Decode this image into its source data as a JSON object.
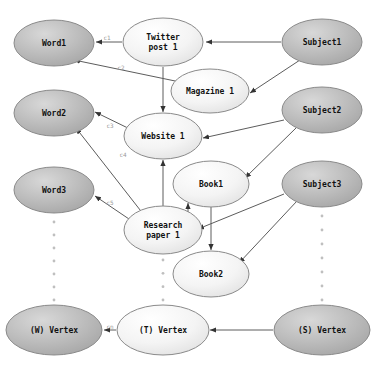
{
  "diagram": {
    "canvas": {
      "width": 374,
      "height": 365,
      "background": "#ffffff"
    },
    "styles": {
      "dark_node_fill": "#b9b9b9",
      "light_node_fill": "#f2f2f2",
      "mid_node_fill": "#e4e4e4",
      "node_stroke": "#8a8a8a",
      "edge_stroke": "#5c5c5c",
      "edge_label_color": "#9a9a9a",
      "dot_color": "#bfbfbf",
      "label_color": "#111111"
    },
    "nodes": [
      {
        "id": "word1",
        "label": "Word1",
        "lines": [
          "Word1"
        ],
        "cx": 54,
        "cy": 43,
        "rx": 40,
        "ry": 23,
        "shade": "dark"
      },
      {
        "id": "word2",
        "label": "Word2",
        "lines": [
          "Word2"
        ],
        "cx": 54,
        "cy": 113,
        "rx": 40,
        "ry": 23,
        "shade": "dark"
      },
      {
        "id": "word3",
        "label": "Word3",
        "lines": [
          "Word3"
        ],
        "cx": 54,
        "cy": 190,
        "rx": 40,
        "ry": 23,
        "shade": "dark"
      },
      {
        "id": "wvertex",
        "label": "(W) Vertex",
        "lines": [
          "(W) Vertex"
        ],
        "cx": 54,
        "cy": 330,
        "rx": 48,
        "ry": 25,
        "shade": "dark"
      },
      {
        "id": "twitter",
        "label": "Twitter post 1",
        "lines": [
          "Twitter",
          "post 1"
        ],
        "cx": 163,
        "cy": 42,
        "rx": 40,
        "ry": 24,
        "shade": "light"
      },
      {
        "id": "magazine",
        "label": "Magazine 1",
        "lines": [
          "Magazine 1"
        ],
        "cx": 210,
        "cy": 91,
        "rx": 39,
        "ry": 22,
        "shade": "light"
      },
      {
        "id": "website",
        "label": "Website 1",
        "lines": [
          "Website 1"
        ],
        "cx": 163,
        "cy": 136,
        "rx": 39,
        "ry": 23,
        "shade": "light"
      },
      {
        "id": "book1",
        "label": "Book1",
        "lines": [
          "Book1"
        ],
        "cx": 211,
        "cy": 184,
        "rx": 38,
        "ry": 23,
        "shade": "light"
      },
      {
        "id": "research",
        "label": "Research paper 1",
        "lines": [
          "Research",
          "paper 1"
        ],
        "cx": 163,
        "cy": 230,
        "rx": 39,
        "ry": 24,
        "shade": "light"
      },
      {
        "id": "book2",
        "label": "Book2",
        "lines": [
          "Book2"
        ],
        "cx": 211,
        "cy": 274,
        "rx": 38,
        "ry": 23,
        "shade": "light"
      },
      {
        "id": "tvertex",
        "label": "(T) Vertex",
        "lines": [
          "(T) Vertex"
        ],
        "cx": 163,
        "cy": 330,
        "rx": 46,
        "ry": 25,
        "shade": "light"
      },
      {
        "id": "subject1",
        "label": "Subject1",
        "lines": [
          "Subject1"
        ],
        "cx": 322,
        "cy": 42,
        "rx": 40,
        "ry": 23,
        "shade": "dark"
      },
      {
        "id": "subject2",
        "label": "Subject2",
        "lines": [
          "Subject2"
        ],
        "cx": 322,
        "cy": 110,
        "rx": 40,
        "ry": 23,
        "shade": "dark"
      },
      {
        "id": "subject3",
        "label": "Subject3",
        "lines": [
          "Subject3"
        ],
        "cx": 322,
        "cy": 184,
        "rx": 40,
        "ry": 23,
        "shade": "dark"
      },
      {
        "id": "svertex",
        "label": "(S) Vertex",
        "lines": [
          "(S) Vertex"
        ],
        "cx": 322,
        "cy": 330,
        "rx": 48,
        "ry": 25,
        "shade": "dark"
      }
    ],
    "edges": [
      {
        "id": "e-twitter-word1",
        "from": "twitter",
        "to": "word1",
        "label": "c1",
        "x1": 122,
        "y1": 42,
        "x2": 96,
        "y2": 42,
        "lx": 107,
        "ly": 38
      },
      {
        "id": "e-subject1-twitter",
        "from": "subject1",
        "to": "twitter",
        "label": "",
        "x1": 281,
        "y1": 42,
        "x2": 206,
        "y2": 42,
        "lx": 0,
        "ly": 0
      },
      {
        "id": "e-magazine-word1",
        "from": "magazine",
        "to": "word1",
        "label": "c2",
        "x1": 180,
        "y1": 82,
        "x2": 74,
        "y2": 60,
        "lx": 121,
        "ly": 68
      },
      {
        "id": "e-twitter-website",
        "from": "twitter",
        "to": "website",
        "label": "",
        "x1": 163,
        "y1": 67,
        "x2": 163,
        "y2": 112,
        "lx": 0,
        "ly": 0
      },
      {
        "id": "e-subject1-magazine",
        "from": "subject1",
        "to": "magazine",
        "label": "",
        "x1": 300,
        "y1": 60,
        "x2": 250,
        "y2": 93,
        "lx": 0,
        "ly": 0
      },
      {
        "id": "e-website-word2",
        "from": "website",
        "to": "word2",
        "label": "c3",
        "x1": 134,
        "y1": 131,
        "x2": 95,
        "y2": 112,
        "lx": 110,
        "ly": 126
      },
      {
        "id": "e-subject2-website",
        "from": "subject2",
        "to": "website",
        "label": "",
        "x1": 284,
        "y1": 120,
        "x2": 203,
        "y2": 138,
        "lx": 0,
        "ly": 0
      },
      {
        "id": "e-research-word2",
        "from": "research",
        "to": "word2",
        "label": "c4",
        "x1": 144,
        "y1": 215,
        "x2": 76,
        "y2": 128,
        "lx": 123,
        "ly": 155
      },
      {
        "id": "e-research-website",
        "from": "research",
        "to": "website",
        "label": "",
        "x1": 163,
        "y1": 207,
        "x2": 163,
        "y2": 160,
        "lx": 0,
        "ly": 0
      },
      {
        "id": "e-subject2-book1",
        "from": "subject2",
        "to": "book1",
        "label": "",
        "x1": 296,
        "y1": 128,
        "x2": 245,
        "y2": 178,
        "lx": 0,
        "ly": 0
      },
      {
        "id": "e-research-word3",
        "from": "research",
        "to": "word3",
        "label": "c5",
        "x1": 129,
        "y1": 219,
        "x2": 95,
        "y2": 196,
        "lx": 110,
        "ly": 203
      },
      {
        "id": "e-research-book1",
        "from": "research",
        "to": "book1",
        "label": "",
        "x1": 188,
        "y1": 217,
        "x2": 188,
        "y2": 203,
        "lx": 0,
        "ly": 0
      },
      {
        "id": "e-subject3-research",
        "from": "subject3",
        "to": "research",
        "label": "",
        "x1": 284,
        "y1": 194,
        "x2": 198,
        "y2": 229,
        "lx": 0,
        "ly": 0
      },
      {
        "id": "e-book1-book2",
        "from": "book1",
        "to": "book2",
        "label": "",
        "x1": 211,
        "y1": 207,
        "x2": 211,
        "y2": 250,
        "lx": 0,
        "ly": 0
      },
      {
        "id": "e-subject3-book2",
        "from": "subject3",
        "to": "book2",
        "label": "",
        "x1": 297,
        "y1": 201,
        "x2": 239,
        "y2": 263,
        "lx": 0,
        "ly": 0
      },
      {
        "id": "e-tvertex-wvertex",
        "from": "tvertex",
        "to": "wvertex",
        "label": "cn",
        "x1": 116,
        "y1": 330,
        "x2": 104,
        "y2": 330,
        "lx": 110,
        "ly": 327
      },
      {
        "id": "e-svertex-tvertex",
        "from": "svertex",
        "to": "tvertex",
        "label": "",
        "x1": 273,
        "y1": 330,
        "x2": 210,
        "y2": 330,
        "lx": 0,
        "ly": 0
      }
    ],
    "dot_columns": [
      {
        "id": "dots-word",
        "x": 54,
        "y_start": 222,
        "y_end": 300,
        "count": 7
      },
      {
        "id": "dots-text",
        "x": 163,
        "y_start": 260,
        "y_end": 300,
        "count": 4
      },
      {
        "id": "dots-subject",
        "x": 322,
        "y_start": 216,
        "y_end": 300,
        "count": 7
      }
    ]
  }
}
